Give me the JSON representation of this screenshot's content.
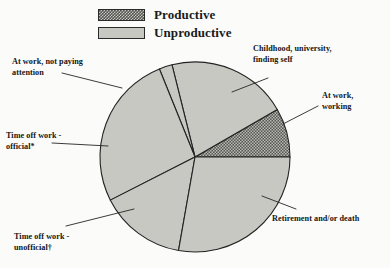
{
  "legend": {
    "items": [
      {
        "label": "Productive",
        "swatch": "productive",
        "color": "#555553"
      },
      {
        "label": "Unproductive",
        "swatch": "unproductive",
        "color": "#c8c8c3"
      }
    ]
  },
  "callouts": {
    "not_paying_attention": "At work, not paying\nattention",
    "childhood": "Childhood, university,\nfinding self",
    "at_work_working": "At work,\nworking",
    "time_off_official": "Time off work -\nofficial*",
    "time_off_unofficial": "Time off work -\nunofficial†",
    "retirement": "Retirement and/or death"
  },
  "chart_data": {
    "type": "pie",
    "title": "",
    "subtitle": "",
    "xlabel": "",
    "ylabel": "",
    "legend_position": "top-center",
    "grid": false,
    "center": {
      "x": 195,
      "y": 157
    },
    "radius": 95,
    "start_angle_deg": 0,
    "direction": "counterclockwise",
    "categories": [
      "At work, working",
      "Childhood, university, finding self",
      "At work, not paying attention",
      "Time off work - official*",
      "Time off work - unofficial†",
      "Retirement and/or death"
    ],
    "values": [
      8.3,
      20.6,
      2.2,
      26.4,
      14.7,
      27.8
    ],
    "slices": [
      {
        "label": "At work, working",
        "group": "Productive",
        "value": 8.3,
        "start_deg": 0,
        "end_deg": 30,
        "fill": "#555553",
        "pattern": "checker"
      },
      {
        "label": "Childhood, university, finding self",
        "group": "Unproductive",
        "value": 20.6,
        "start_deg": 30,
        "end_deg": 104,
        "fill": "#c8c8c3",
        "pattern": "solid"
      },
      {
        "label": "At work, not paying attention",
        "group": "Unproductive",
        "value": 2.2,
        "start_deg": 104,
        "end_deg": 112,
        "fill": "#c8c8c3",
        "pattern": "solid"
      },
      {
        "label": "Time off work - official*",
        "group": "Unproductive",
        "value": 26.4,
        "start_deg": 112,
        "end_deg": 207,
        "fill": "#c8c8c3",
        "pattern": "solid"
      },
      {
        "label": "Time off work - unofficial†",
        "group": "Unproductive",
        "value": 14.7,
        "start_deg": 207,
        "end_deg": 260,
        "fill": "#c8c8c3",
        "pattern": "solid"
      },
      {
        "label": "Retirement and/or death",
        "group": "Unproductive",
        "value": 27.8,
        "start_deg": 260,
        "end_deg": 360,
        "fill": "#c8c8c3",
        "pattern": "solid"
      }
    ]
  }
}
